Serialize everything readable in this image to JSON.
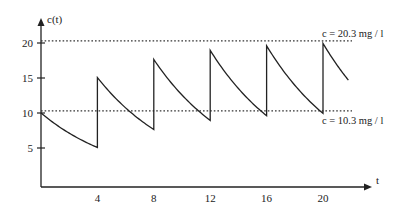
{
  "chart_data": {
    "type": "line",
    "title": "",
    "xlabel": "t",
    "ylabel": "c(t)",
    "xlim": [
      0,
      22
    ],
    "ylim": [
      0,
      22
    ],
    "x_ticks": [
      4,
      8,
      12,
      16,
      20
    ],
    "x_tick_labels": [
      "4",
      "8",
      "12",
      "16",
      "20"
    ],
    "y_ticks": [
      5,
      10,
      15,
      20
    ],
    "y_tick_labels": [
      "5",
      "10",
      "15",
      "20"
    ],
    "grid": false,
    "legend": "none",
    "dosing_interval": 4,
    "dose_increment": 10,
    "series": [
      {
        "name": "c(t)",
        "description": "Repeated dosing every 4 time units; exponential decay between doses",
        "initial_value": 10,
        "decay_rate": 0.1697,
        "t_end": 21.8,
        "peaks": [
          {
            "t": 0,
            "value": 10.0
          },
          {
            "t": 4,
            "value": 15.1
          },
          {
            "t": 8,
            "value": 17.7
          },
          {
            "t": 12,
            "value": 19.0
          },
          {
            "t": 16,
            "value": 19.6
          },
          {
            "t": 20,
            "value": 20.0
          }
        ],
        "troughs": [
          {
            "t": 4,
            "value": 5.1
          },
          {
            "t": 8,
            "value": 7.7
          },
          {
            "t": 12,
            "value": 9.0
          },
          {
            "t": 16,
            "value": 9.6
          },
          {
            "t": 20,
            "value": 10.0
          }
        ]
      }
    ],
    "reference_lines": [
      {
        "y": 20.3,
        "style": "dotted",
        "label": "c = 20.3 mg / l"
      },
      {
        "y": 10.3,
        "style": "dotted",
        "label": "c = 10.3 mg / l"
      }
    ]
  }
}
